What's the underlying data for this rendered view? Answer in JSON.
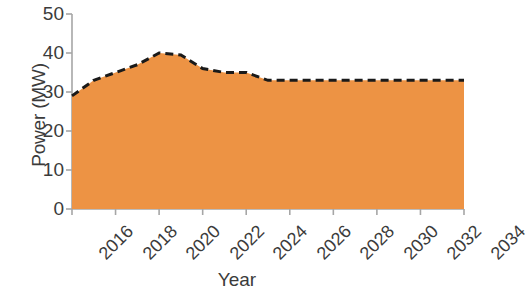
{
  "chart_data": {
    "type": "area",
    "title": "",
    "xlabel": "Year",
    "ylabel": "Power (MW)",
    "xlim": [
      2016,
      2034
    ],
    "ylim": [
      0,
      50
    ],
    "grid": false,
    "legend": "none",
    "series_style": {
      "fill_color": "#ED9344",
      "line_color": "#1a1a1a",
      "line_style": "dashed",
      "line_width": 3
    },
    "x_tick_labels": [
      "2016",
      "2018",
      "2020",
      "2022",
      "2024",
      "2026",
      "2028",
      "2030",
      "2032",
      "2034"
    ],
    "x_tick_values": [
      2016,
      2018,
      2020,
      2022,
      2024,
      2026,
      2028,
      2030,
      2032,
      2034
    ],
    "y_tick_labels": [
      "0",
      "10",
      "20",
      "30",
      "40",
      "50"
    ],
    "y_tick_values": [
      0,
      10,
      20,
      30,
      40,
      50
    ],
    "x": [
      2016,
      2017,
      2018,
      2019,
      2020,
      2021,
      2022,
      2023,
      2024,
      2025,
      2026,
      2027,
      2028,
      2029,
      2030,
      2031,
      2032,
      2033,
      2034
    ],
    "values": [
      29,
      33,
      35,
      37,
      40,
      39.5,
      36,
      35,
      35,
      33,
      33,
      33,
      33,
      33,
      33,
      33,
      33,
      33,
      33
    ],
    "series": [
      {
        "name": "Power",
        "values": [
          29,
          33,
          35,
          37,
          40,
          39.5,
          36,
          35,
          35,
          33,
          33,
          33,
          33,
          33,
          33,
          33,
          33,
          33,
          33
        ]
      }
    ]
  },
  "axes": {
    "y_title": "Power (MW)",
    "x_title": "Year"
  }
}
